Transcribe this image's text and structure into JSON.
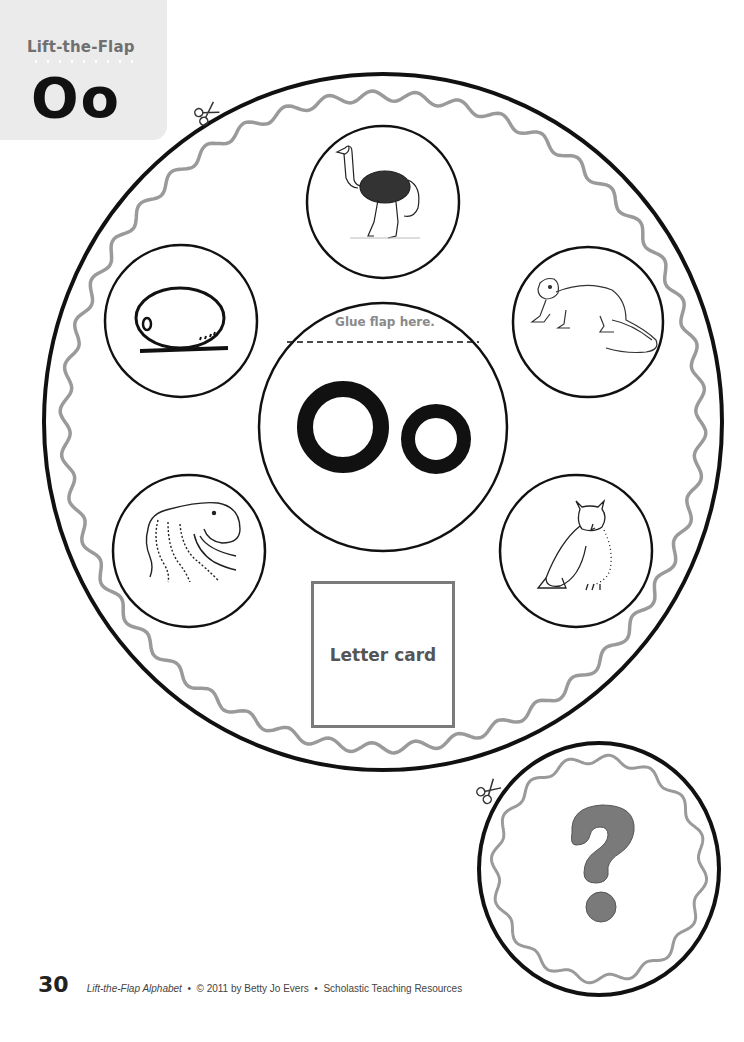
{
  "header": {
    "title": "Lift-the-Flap",
    "letter": "Oo"
  },
  "wheel": {
    "glue_label": "Glue flap here.",
    "center_letter": "Oo",
    "letter_card_label": "Letter card",
    "pictures": [
      {
        "name": "ostrich",
        "position": "top"
      },
      {
        "name": "otter",
        "position": "upper-right"
      },
      {
        "name": "owl",
        "position": "lower-right"
      },
      {
        "name": "octopus",
        "position": "lower-left"
      },
      {
        "name": "oval",
        "position": "upper-left"
      }
    ]
  },
  "flap": {
    "symbol": "?"
  },
  "icons": [
    "scissors-icon",
    "scissors-icon"
  ],
  "footer": {
    "page_number": "30",
    "book_title": "Lift-the-Flap Alphabet",
    "separator": "•",
    "copyright": "© 2011 by Betty Jo Evers",
    "publisher": "Scholastic Teaching Resources"
  },
  "colors": {
    "outline": "#111111",
    "wavy_border": "#9a9a9a",
    "tab_bg": "#ebebeb",
    "question_mark": "#7a7a7a"
  }
}
